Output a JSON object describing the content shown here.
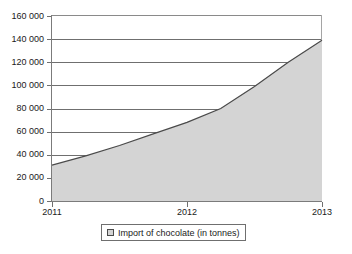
{
  "chart_data": {
    "type": "area",
    "title": "",
    "subtitle": "",
    "xlabel": "",
    "ylabel": "",
    "grid": true,
    "legend_position": "bottom",
    "xlim": [
      2011,
      2013
    ],
    "ylim": [
      0,
      160000
    ],
    "ytick_labels": [
      "160 000",
      "140 000",
      "120 000",
      "100 000",
      "80 000",
      "60 000",
      "40 000",
      "20 000",
      "0"
    ],
    "ytick_values": [
      160000,
      140000,
      120000,
      100000,
      80000,
      60000,
      40000,
      20000,
      0
    ],
    "xtick_labels": [
      "2011",
      "2012",
      "2013"
    ],
    "xtick_values": [
      2011,
      2012,
      2013
    ],
    "series": [
      {
        "name": "Import of chocolate (in tonnes)",
        "fill_color": "#d4d4d4",
        "line_color": "#4a4a4a",
        "x": [
          2011,
          2011.25,
          2011.5,
          2011.75,
          2012,
          2012.25,
          2012.5,
          2012.75,
          2013
        ],
        "values": [
          31000,
          39000,
          48000,
          58000,
          68000,
          80000,
          99000,
          120000,
          139000
        ]
      }
    ],
    "legend": [
      {
        "label": "Import of chocolate (in tonnes)",
        "swatch_color": "#d4d4d4"
      }
    ]
  },
  "colors": {
    "area_fill": "#d4d4d4",
    "area_stroke": "#4a4a4a",
    "gridline": "#6f6f6f",
    "axis": "#7b7b7b",
    "text": "#1a1a1a",
    "background": "#ffffff"
  }
}
